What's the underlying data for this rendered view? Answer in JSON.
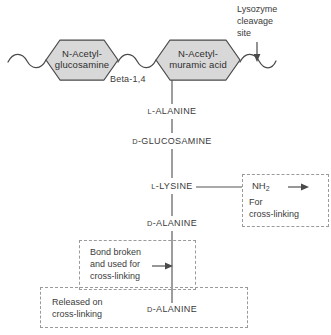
{
  "diagram": {
    "backbone": {
      "sugars": [
        {
          "id": "nag",
          "line1": "N-Acetyl-",
          "line2": "glucosamine"
        },
        {
          "id": "nam",
          "line1": "N-Acetyl-",
          "line2": "muramic acid"
        }
      ],
      "bond_label": "Beta-1,4",
      "cleavage": {
        "line1": "Lysozyme",
        "line2": "cleavage",
        "line3": "site",
        "arrow": "down-arrow"
      }
    },
    "peptide_chain": [
      {
        "prefix": "L",
        "name": "-ALANINE"
      },
      {
        "prefix": "D",
        "name": "-GLUCOSAMINE"
      },
      {
        "prefix": "L",
        "name": "-LYSINE"
      },
      {
        "prefix": "D",
        "name": "-ALANINE"
      },
      {
        "prefix": "D",
        "name": "-ALANINE"
      }
    ],
    "annotations": {
      "amine": {
        "group": "NH",
        "subscript": "2",
        "line1": "For",
        "line2": "cross-linking"
      },
      "bond_broken": {
        "line1": "Bond broken",
        "line2": "and used for",
        "line3": "cross-linking"
      },
      "released": {
        "line1": "Released on",
        "line2": "cross-linking"
      }
    },
    "colors": {
      "hexagon_fill": "#d8d8d8",
      "hexagon_stroke": "#4a4a4a",
      "line": "#555555",
      "dashed": "#9a9a9a",
      "text": "#3b3b3b",
      "background": "#ffffff"
    }
  }
}
